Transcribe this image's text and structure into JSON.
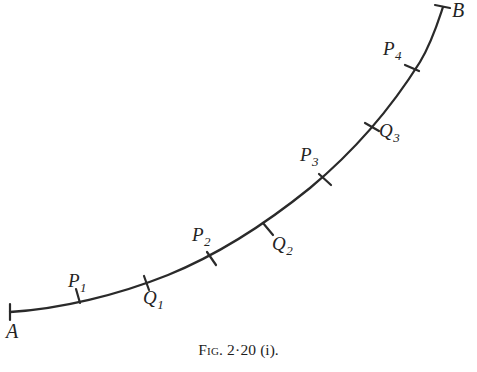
{
  "figure": {
    "caption_prefix": "Fig.",
    "caption_number": "2·20",
    "caption_suffix": "(i).",
    "caption_full": "Fig. 2·20 (i).",
    "stroke_color": "#2a2a2a",
    "background_color": "#ffffff",
    "label_color": "#232323"
  },
  "endpoints": [
    {
      "id": "A",
      "label": "A",
      "x": 10,
      "y": 312,
      "label_x": 6,
      "label_y": 322
    },
    {
      "id": "B",
      "label": "B",
      "x": 443,
      "y": 6,
      "label_x": 452,
      "label_y": 0
    }
  ],
  "points": [
    {
      "id": "P1",
      "letter": "P",
      "subscript": "1",
      "x": 78,
      "y": 296,
      "label_x": 68,
      "label_y": 271
    },
    {
      "id": "Q1",
      "letter": "Q",
      "subscript": "1",
      "x": 146,
      "y": 283,
      "label_x": 143,
      "label_y": 288
    },
    {
      "id": "P2",
      "letter": "P",
      "subscript": "2",
      "x": 211,
      "y": 258,
      "label_x": 192,
      "label_y": 225
    },
    {
      "id": "Q2",
      "letter": "Q",
      "subscript": "2",
      "x": 268,
      "y": 229,
      "label_x": 272,
      "label_y": 234
    },
    {
      "id": "P3",
      "letter": "P",
      "subscript": "3",
      "x": 325,
      "y": 179,
      "label_x": 300,
      "label_y": 145
    },
    {
      "id": "Q3",
      "letter": "Q",
      "subscript": "3",
      "x": 372,
      "y": 127,
      "label_x": 379,
      "label_y": 121
    },
    {
      "id": "P4",
      "letter": "P",
      "subscript": "4",
      "x": 412,
      "y": 68,
      "label_x": 383,
      "label_y": 39
    }
  ],
  "curve": {
    "description": "Smooth upward-sweeping arc from A at lower left to B at upper right",
    "path": "M 10,312 C 60,309 118,295 168,275 C 222,253 268,222 310,188 C 352,153 390,110 420,62 C 432,42 438,22 443,7"
  },
  "tick_marks": {
    "length": 13,
    "stroke_width": 2,
    "note": "short strokes drawn perpendicular to the curve at each labelled point"
  }
}
